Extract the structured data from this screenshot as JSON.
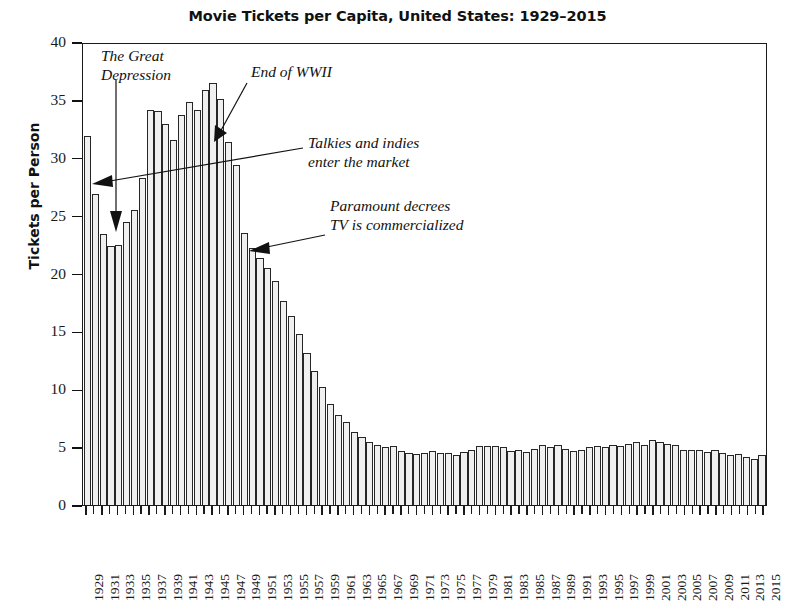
{
  "chart_data": {
    "type": "bar",
    "title": "Movie Tickets per Capita, United States: 1929–2015",
    "xlabel": "",
    "ylabel": "Tickets per Person",
    "ylim": [
      0,
      40
    ],
    "yticks": [
      0,
      5,
      10,
      15,
      20,
      25,
      30,
      35,
      40
    ],
    "xtick_labels": [
      "1929",
      "1931",
      "1933",
      "1935",
      "1937",
      "1939",
      "1941",
      "1943",
      "1945",
      "1947",
      "1949",
      "1951",
      "1953",
      "1955",
      "1957",
      "1959",
      "1961",
      "1963",
      "1965",
      "1967",
      "1969",
      "1971",
      "1973",
      "1975",
      "1977",
      "1979",
      "1981",
      "1983",
      "1985",
      "1987",
      "1989",
      "1991",
      "1993",
      "1995",
      "1997",
      "1999",
      "2001",
      "2003",
      "2005",
      "2007",
      "2009",
      "2011",
      "2013",
      "2015"
    ],
    "grid": false,
    "legend": false,
    "categories": [
      1929,
      1930,
      1931,
      1932,
      1933,
      1934,
      1935,
      1936,
      1937,
      1938,
      1939,
      1940,
      1941,
      1942,
      1943,
      1944,
      1945,
      1946,
      1947,
      1948,
      1949,
      1950,
      1951,
      1952,
      1953,
      1954,
      1955,
      1956,
      1957,
      1958,
      1959,
      1960,
      1961,
      1962,
      1963,
      1964,
      1965,
      1966,
      1967,
      1968,
      1969,
      1970,
      1971,
      1972,
      1973,
      1974,
      1975,
      1976,
      1977,
      1978,
      1979,
      1980,
      1981,
      1982,
      1983,
      1984,
      1985,
      1986,
      1987,
      1988,
      1989,
      1990,
      1991,
      1992,
      1993,
      1994,
      1995,
      1996,
      1997,
      1998,
      1999,
      2000,
      2001,
      2002,
      2003,
      2004,
      2005,
      2006,
      2007,
      2008,
      2009,
      2010,
      2011,
      2012,
      2013,
      2014,
      2015
    ],
    "values": [
      32.0,
      27.0,
      23.5,
      22.5,
      22.6,
      24.6,
      25.6,
      28.4,
      34.3,
      34.2,
      33.1,
      31.7,
      33.8,
      35.0,
      34.3,
      36.0,
      36.6,
      35.2,
      31.5,
      29.5,
      23.6,
      22.3,
      21.4,
      20.6,
      19.4,
      17.7,
      16.4,
      14.8,
      13.2,
      11.6,
      10.2,
      8.8,
      7.8,
      7.2,
      6.3,
      5.9,
      5.5,
      5.2,
      5.0,
      5.1,
      4.7,
      4.5,
      4.4,
      4.5,
      4.7,
      4.5,
      4.5,
      4.3,
      4.6,
      4.8,
      5.1,
      5.1,
      5.1,
      5.0,
      4.7,
      4.8,
      4.6,
      4.9,
      5.2,
      5.0,
      5.2,
      4.9,
      4.7,
      4.8,
      5.0,
      5.1,
      5.0,
      5.2,
      5.1,
      5.3,
      5.5,
      5.2,
      5.6,
      5.5,
      5.3,
      5.2,
      4.8,
      4.8,
      4.8,
      4.6,
      4.8,
      4.5,
      4.3,
      4.4,
      4.2,
      4.0,
      4.3
    ]
  },
  "annotations": [
    {
      "id": "great-depression",
      "text": "The Great\nDepression"
    },
    {
      "id": "end-of-wwii",
      "text": "End of WWII"
    },
    {
      "id": "talkies-indies",
      "text": "Talkies and indies\nenter the market"
    },
    {
      "id": "paramount-tv",
      "text": "Paramount decrees\nTV is commercialized"
    }
  ]
}
